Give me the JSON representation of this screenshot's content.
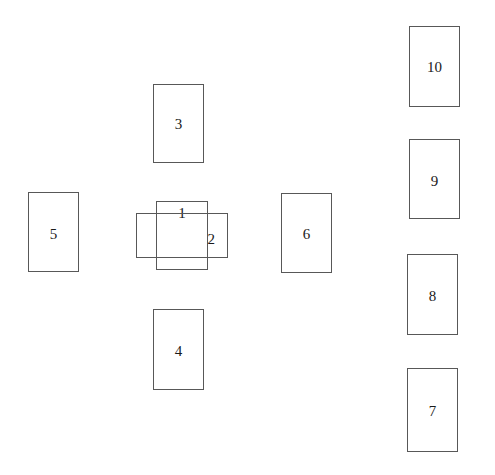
{
  "diagram": {
    "background_color": "#ffffff",
    "stroke_color": "#585858",
    "label_color": "#1a1a1a",
    "width": 495,
    "height": 475,
    "shapes": [
      {
        "id": "rect-1",
        "label": "1",
        "orientation": "portrait",
        "group": "center-overlap",
        "x": 156,
        "y": 201,
        "width": 52,
        "height": 69,
        "label_x": 0,
        "label_y": 205
      },
      {
        "id": "rect-2",
        "label": "2",
        "orientation": "landscape",
        "group": "center-overlap",
        "x": 136,
        "y": 213,
        "width": 92,
        "height": 45,
        "label_x": 0,
        "label_y": 231
      },
      {
        "id": "rect-3",
        "label": "3",
        "orientation": "portrait",
        "group": "cross-arm-top",
        "x": 153,
        "y": 84,
        "width": 51,
        "height": 79,
        "label_x": 0,
        "label_y": 116
      },
      {
        "id": "rect-4",
        "label": "4",
        "orientation": "portrait",
        "group": "cross-arm-bottom",
        "x": 153,
        "y": 309,
        "width": 51,
        "height": 81,
        "label_x": 0,
        "label_y": 343
      },
      {
        "id": "rect-5",
        "label": "5",
        "orientation": "portrait",
        "group": "cross-arm-left",
        "x": 28,
        "y": 192,
        "width": 51,
        "height": 80,
        "label_x": 0,
        "label_y": 226
      },
      {
        "id": "rect-6",
        "label": "6",
        "orientation": "portrait",
        "group": "cross-arm-right",
        "x": 281,
        "y": 193,
        "width": 51,
        "height": 80,
        "label_x": 0,
        "label_y": 226
      },
      {
        "id": "rect-7",
        "label": "7",
        "orientation": "portrait",
        "group": "right-column",
        "x": 407,
        "y": 368,
        "width": 51,
        "height": 84,
        "label_x": 0,
        "label_y": 403
      },
      {
        "id": "rect-8",
        "label": "8",
        "orientation": "portrait",
        "group": "right-column",
        "x": 407,
        "y": 254,
        "width": 51,
        "height": 81,
        "label_x": 0,
        "label_y": 288
      },
      {
        "id": "rect-9",
        "label": "9",
        "orientation": "portrait",
        "group": "right-column",
        "x": 409,
        "y": 139,
        "width": 51,
        "height": 80,
        "label_x": 0,
        "label_y": 173
      },
      {
        "id": "rect-10",
        "label": "10",
        "orientation": "portrait",
        "group": "right-column",
        "x": 409,
        "y": 26,
        "width": 51,
        "height": 81,
        "label_x": 0,
        "label_y": 59
      }
    ]
  }
}
